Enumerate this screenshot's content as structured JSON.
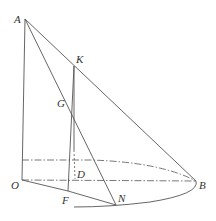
{
  "diagram": {
    "type": "solid-geometry",
    "points": [
      {
        "name": "A",
        "label": "A",
        "x": 25,
        "y": 19
      },
      {
        "name": "K",
        "label": "K",
        "x": 74,
        "y": 66
      },
      {
        "name": "G",
        "label": "G",
        "x": 67,
        "y": 103
      },
      {
        "name": "O",
        "label": "O",
        "x": 22,
        "y": 180
      },
      {
        "name": "D",
        "label": "D",
        "x": 75,
        "y": 179
      },
      {
        "name": "F",
        "label": "F",
        "x": 68,
        "y": 191
      },
      {
        "name": "N",
        "label": "N",
        "x": 116,
        "y": 205
      },
      {
        "name": "B",
        "label": "B",
        "x": 196,
        "y": 181
      }
    ],
    "labels": {
      "A": "A",
      "K": "K",
      "G": "G",
      "O": "O",
      "D": "D",
      "F": "F",
      "N": "N",
      "B": "B"
    },
    "segments_solid": [
      "AO",
      "AB",
      "AN",
      "KF",
      "KD_upper",
      "OF",
      "FN",
      "GF"
    ],
    "segments_dashed": [
      "OB",
      "KD",
      "top-ellipse"
    ],
    "colors": {
      "line": "#555555",
      "label": "#333333",
      "background": "#ffffff"
    }
  }
}
